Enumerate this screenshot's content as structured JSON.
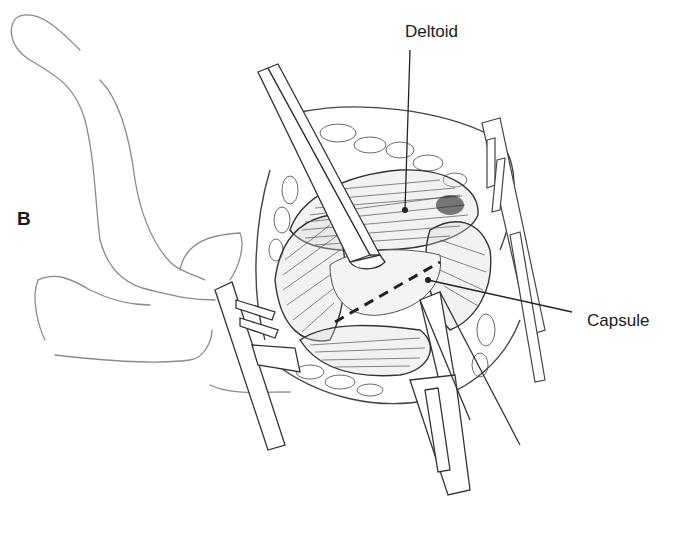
{
  "figure": {
    "panel_letter": "B",
    "labels": {
      "deltoid": "Deltoid",
      "capsule": "Capsule"
    },
    "colors": {
      "ink": "#1a1a1a",
      "line": "#555555",
      "light_line": "#9a9a9a",
      "background": "#ffffff"
    }
  }
}
